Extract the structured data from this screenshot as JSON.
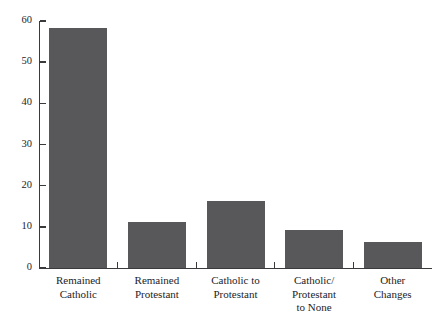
{
  "chart_data": {
    "type": "bar",
    "title": "",
    "subtitle": "",
    "xlabel": "",
    "ylabel": "",
    "categories": [
      "Remained\nCatholic",
      "Remained\nProtestant",
      "Catholic to\nProtestant",
      "Catholic/\nProtestant\nto None",
      "Other\nChanges"
    ],
    "values": [
      58.4,
      11.1,
      16.2,
      9.2,
      6.2
    ],
    "ylim": [
      0,
      60
    ],
    "yticks": [
      0,
      10,
      20,
      30,
      40,
      50,
      60
    ],
    "ytick_labels": [
      "0",
      "10",
      "20",
      "30",
      "40",
      "50",
      "60"
    ],
    "grid": false,
    "legend": false,
    "bar_color": "#58585a",
    "axis_color": "#3a3a3c",
    "background_color": "#ffffff"
  }
}
